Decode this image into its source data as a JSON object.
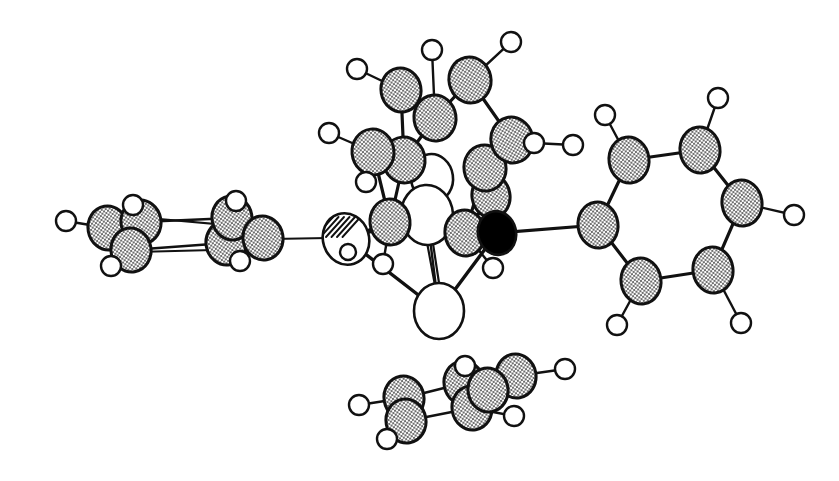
{
  "figure": {
    "subtitle": "ORTEP-style ball-and-stick crystallographic structure drawing",
    "type": "chemical-structure-diagram",
    "background_color": "#ffffff",
    "outline_color": "#111111",
    "canvas": {
      "width": 839,
      "height": 481
    },
    "caption": ""
  },
  "legend": {
    "styles": [
      {
        "key": "carbon",
        "label": "carbon",
        "fill": "#8f8f8f",
        "pattern": "checkerboard-hatch",
        "note": "medium shaded sphere"
      },
      {
        "key": "hydrogen",
        "label": "hydrogen",
        "fill": "#ffffff",
        "pattern": "open",
        "note": "small open circle"
      },
      {
        "key": "metal_open",
        "label": "metal (open)",
        "fill": "#ffffff",
        "pattern": "open",
        "note": "large open sphere"
      },
      {
        "key": "metal_hatched",
        "label": "metal (line-hatched)",
        "fill": "#ffffff",
        "pattern": "diagonal-lines",
        "note": "large sphere with diagonal hatch lines"
      },
      {
        "key": "heteroatom_black",
        "label": "heteroatom (solid)",
        "fill": "#000000",
        "pattern": "solid",
        "note": "solid black sphere"
      }
    ]
  },
  "chart_data": {
    "type": "scatter",
    "xlabel": "",
    "ylabel": "",
    "grid": false,
    "legend_position": "none",
    "xlim": [
      0,
      839
    ],
    "ylim": [
      0,
      481
    ],
    "counts": {
      "carbon_spheres": 28,
      "hydrogen_circles": 26,
      "open_metal_spheres": 3,
      "hatched_metal_spheres": 1,
      "solid_black_spheres": 1,
      "bonds": 63
    },
    "atoms": [
      {
        "id": "M1",
        "style": "metal_hatched",
        "x": 346,
        "y": 239,
        "rx": 23,
        "ry": 26,
        "rot": -18,
        "z": 20
      },
      {
        "id": "M2",
        "style": "metal_open",
        "x": 432,
        "y": 178,
        "rx": 21,
        "ry": 24,
        "rot": -8,
        "z": 14
      },
      {
        "id": "M3",
        "style": "metal_open",
        "x": 427,
        "y": 215,
        "rx": 26,
        "ry": 30,
        "rot": -4,
        "z": 16
      },
      {
        "id": "M4",
        "style": "metal_open",
        "x": 439,
        "y": 311,
        "rx": 25,
        "ry": 28,
        "rot": 0,
        "z": 14
      },
      {
        "id": "X1",
        "style": "heteroatom_black",
        "x": 497,
        "y": 233,
        "rx": 19,
        "ry": 22,
        "rot": -14,
        "z": 40
      },
      {
        "id": "C1",
        "style": "carbon",
        "x": 401,
        "y": 90,
        "rx": 20,
        "ry": 22,
        "rot": -10,
        "z": 26
      },
      {
        "id": "C2",
        "style": "carbon",
        "x": 470,
        "y": 80,
        "rx": 21,
        "ry": 23,
        "rot": -12,
        "z": 26
      },
      {
        "id": "C3",
        "style": "carbon",
        "x": 435,
        "y": 118,
        "rx": 21,
        "ry": 23,
        "rot": -8,
        "z": 25
      },
      {
        "id": "C4",
        "style": "carbon",
        "x": 512,
        "y": 140,
        "rx": 21,
        "ry": 23,
        "rot": -14,
        "z": 25
      },
      {
        "id": "C5",
        "style": "carbon",
        "x": 373,
        "y": 152,
        "rx": 21,
        "ry": 23,
        "rot": -6,
        "z": 24
      },
      {
        "id": "C6",
        "style": "carbon",
        "x": 404,
        "y": 160,
        "rx": 21,
        "ry": 23,
        "rot": -6,
        "z": 23
      },
      {
        "id": "C7",
        "style": "carbon",
        "x": 485,
        "y": 168,
        "rx": 21,
        "ry": 23,
        "rot": -10,
        "z": 24
      },
      {
        "id": "C8",
        "style": "carbon",
        "x": 491,
        "y": 196,
        "rx": 19,
        "ry": 22,
        "rot": -10,
        "z": 22
      },
      {
        "id": "C9",
        "style": "carbon",
        "x": 390,
        "y": 222,
        "rx": 20,
        "ry": 23,
        "rot": -6,
        "z": 21
      },
      {
        "id": "C10",
        "style": "carbon",
        "x": 465,
        "y": 233,
        "rx": 20,
        "ry": 23,
        "rot": -8,
        "z": 21
      },
      {
        "id": "C11",
        "style": "carbon",
        "x": 598,
        "y": 225,
        "rx": 20,
        "ry": 23,
        "rot": -8,
        "z": 18
      },
      {
        "id": "C12",
        "style": "carbon",
        "x": 629,
        "y": 160,
        "rx": 20,
        "ry": 23,
        "rot": -8,
        "z": 18
      },
      {
        "id": "C13",
        "style": "carbon",
        "x": 700,
        "y": 150,
        "rx": 20,
        "ry": 23,
        "rot": -8,
        "z": 18
      },
      {
        "id": "C14",
        "style": "carbon",
        "x": 742,
        "y": 203,
        "rx": 20,
        "ry": 23,
        "rot": -8,
        "z": 18
      },
      {
        "id": "C15",
        "style": "carbon",
        "x": 713,
        "y": 270,
        "rx": 20,
        "ry": 23,
        "rot": -8,
        "z": 18
      },
      {
        "id": "C16",
        "style": "carbon",
        "x": 641,
        "y": 281,
        "rx": 20,
        "ry": 23,
        "rot": -8,
        "z": 18
      },
      {
        "id": "C21",
        "style": "carbon",
        "x": 108,
        "y": 228,
        "rx": 20,
        "ry": 22,
        "rot": -10,
        "z": 12
      },
      {
        "id": "C22",
        "style": "carbon",
        "x": 141,
        "y": 222,
        "rx": 20,
        "ry": 22,
        "rot": -10,
        "z": 12
      },
      {
        "id": "C23",
        "style": "carbon",
        "x": 131,
        "y": 250,
        "rx": 20,
        "ry": 22,
        "rot": -10,
        "z": 12
      },
      {
        "id": "C24",
        "style": "carbon",
        "x": 226,
        "y": 243,
        "rx": 20,
        "ry": 22,
        "rot": -10,
        "z": 12
      },
      {
        "id": "C25",
        "style": "carbon",
        "x": 232,
        "y": 218,
        "rx": 20,
        "ry": 22,
        "rot": -10,
        "z": 12
      },
      {
        "id": "C26",
        "style": "carbon",
        "x": 263,
        "y": 238,
        "rx": 20,
        "ry": 22,
        "rot": -10,
        "z": 12
      },
      {
        "id": "C31",
        "style": "carbon",
        "x": 404,
        "y": 398,
        "rx": 20,
        "ry": 22,
        "rot": -10,
        "z": 10
      },
      {
        "id": "C32",
        "style": "carbon",
        "x": 406,
        "y": 421,
        "rx": 20,
        "ry": 22,
        "rot": -10,
        "z": 10
      },
      {
        "id": "C33",
        "style": "carbon",
        "x": 464,
        "y": 383,
        "rx": 20,
        "ry": 22,
        "rot": -10,
        "z": 10
      },
      {
        "id": "C34",
        "style": "carbon",
        "x": 472,
        "y": 408,
        "rx": 20,
        "ry": 22,
        "rot": -10,
        "z": 10
      },
      {
        "id": "C35",
        "style": "carbon",
        "x": 516,
        "y": 376,
        "rx": 20,
        "ry": 22,
        "rot": -10,
        "z": 10
      },
      {
        "id": "C36",
        "style": "carbon",
        "x": 488,
        "y": 390,
        "rx": 20,
        "ry": 22,
        "rot": -10,
        "z": 10
      },
      {
        "id": "H1",
        "style": "hydrogen",
        "x": 357,
        "y": 69,
        "r": 10,
        "z": 30
      },
      {
        "id": "H2",
        "style": "hydrogen",
        "x": 432,
        "y": 50,
        "r": 10,
        "z": 30
      },
      {
        "id": "H3",
        "style": "hydrogen",
        "x": 511,
        "y": 42,
        "r": 10,
        "z": 30
      },
      {
        "id": "H4",
        "style": "hydrogen",
        "x": 329,
        "y": 133,
        "r": 10,
        "z": 30
      },
      {
        "id": "H5",
        "style": "hydrogen",
        "x": 366,
        "y": 182,
        "r": 10,
        "z": 30
      },
      {
        "id": "H6",
        "style": "hydrogen",
        "x": 534,
        "y": 143,
        "r": 10,
        "z": 30
      },
      {
        "id": "H7",
        "style": "hydrogen",
        "x": 573,
        "y": 145,
        "r": 10,
        "z": 30
      },
      {
        "id": "H8",
        "style": "hydrogen",
        "x": 383,
        "y": 264,
        "r": 10,
        "z": 45
      },
      {
        "id": "H9",
        "style": "hydrogen",
        "x": 493,
        "y": 268,
        "r": 10,
        "z": 45
      },
      {
        "id": "H11",
        "style": "hydrogen",
        "x": 605,
        "y": 115,
        "r": 10,
        "z": 22
      },
      {
        "id": "H12",
        "style": "hydrogen",
        "x": 718,
        "y": 98,
        "r": 10,
        "z": 22
      },
      {
        "id": "H13",
        "style": "hydrogen",
        "x": 794,
        "y": 215,
        "r": 10,
        "z": 22
      },
      {
        "id": "H14",
        "style": "hydrogen",
        "x": 741,
        "y": 323,
        "r": 10,
        "z": 22
      },
      {
        "id": "H15",
        "style": "hydrogen",
        "x": 617,
        "y": 325,
        "r": 10,
        "z": 22
      },
      {
        "id": "H21",
        "style": "hydrogen",
        "x": 66,
        "y": 221,
        "r": 10,
        "z": 14
      },
      {
        "id": "H22",
        "style": "hydrogen",
        "x": 133,
        "y": 205,
        "r": 10,
        "z": 18
      },
      {
        "id": "H23",
        "style": "hydrogen",
        "x": 111,
        "y": 266,
        "r": 10,
        "z": 18
      },
      {
        "id": "H24",
        "style": "hydrogen",
        "x": 240,
        "y": 261,
        "r": 10,
        "z": 18
      },
      {
        "id": "H25",
        "style": "hydrogen",
        "x": 236,
        "y": 201,
        "r": 10,
        "z": 18
      },
      {
        "id": "H31",
        "style": "hydrogen",
        "x": 359,
        "y": 405,
        "r": 10,
        "z": 12
      },
      {
        "id": "H32",
        "style": "hydrogen",
        "x": 387,
        "y": 439,
        "r": 10,
        "z": 12
      },
      {
        "id": "H33",
        "style": "hydrogen",
        "x": 465,
        "y": 366,
        "r": 10,
        "z": 12
      },
      {
        "id": "H34",
        "style": "hydrogen",
        "x": 514,
        "y": 416,
        "r": 10,
        "z": 12
      },
      {
        "id": "H35",
        "style": "hydrogen",
        "x": 565,
        "y": 369,
        "r": 10,
        "z": 12
      }
    ],
    "bonds": [
      {
        "a": "C1",
        "b": "H1",
        "w": 2.4
      },
      {
        "a": "C3",
        "b": "H2",
        "w": 2.4
      },
      {
        "a": "C2",
        "b": "H3",
        "w": 2.4
      },
      {
        "a": "C5",
        "b": "H4",
        "w": 2.4
      },
      {
        "a": "C5",
        "b": "H5",
        "w": 2.4
      },
      {
        "a": "C4",
        "b": "H6",
        "w": 2.4
      },
      {
        "a": "H6",
        "b": "H7",
        "w": 2.4
      },
      {
        "a": "C9",
        "b": "H8",
        "w": 2.4
      },
      {
        "a": "C10",
        "b": "H9",
        "w": 2.4
      },
      {
        "a": "C1",
        "b": "C3",
        "w": 3.2
      },
      {
        "a": "C3",
        "b": "C2",
        "w": 3.2
      },
      {
        "a": "C2",
        "b": "C4",
        "w": 3.2
      },
      {
        "a": "C1",
        "b": "C6",
        "w": 3.2
      },
      {
        "a": "C3",
        "b": "C6",
        "w": 3.2
      },
      {
        "a": "C4",
        "b": "C7",
        "w": 3.2
      },
      {
        "a": "C5",
        "b": "C6",
        "w": 3.2
      },
      {
        "a": "C5",
        "b": "C9",
        "w": 3.2
      },
      {
        "a": "C6",
        "b": "C9",
        "w": 3.2
      },
      {
        "a": "C7",
        "b": "C8",
        "w": 3.2
      },
      {
        "a": "C8",
        "b": "C10",
        "w": 3.2
      },
      {
        "a": "C7",
        "b": "C10",
        "w": 3.2
      },
      {
        "a": "M1",
        "b": "C9",
        "w": 3.0
      },
      {
        "a": "M1",
        "b": "M3",
        "w": 3.0
      },
      {
        "a": "M1",
        "b": "M4",
        "w": 3.4
      },
      {
        "a": "M3",
        "b": "C10",
        "w": 3.0
      },
      {
        "a": "M3",
        "b": "M4",
        "w": 2.4
      },
      {
        "a": "M2",
        "b": "M3",
        "w": 2.4
      },
      {
        "a": "M4",
        "b": "X1",
        "w": 3.4
      },
      {
        "a": "C10",
        "b": "X1",
        "w": 3.0
      },
      {
        "a": "C8",
        "b": "X1",
        "w": 3.0
      },
      {
        "a": "M1",
        "b": "C21ringlink",
        "w": 2.4
      },
      {
        "a": "X1",
        "b": "C11",
        "w": 3.0
      },
      {
        "a": "C11",
        "b": "C12",
        "w": 3.2
      },
      {
        "a": "C12",
        "b": "C13",
        "w": 3.2
      },
      {
        "a": "C13",
        "b": "C14",
        "w": 3.2
      },
      {
        "a": "C14",
        "b": "C15",
        "w": 3.2
      },
      {
        "a": "C15",
        "b": "C16",
        "w": 3.2
      },
      {
        "a": "C16",
        "b": "C11",
        "w": 3.2
      },
      {
        "a": "C12",
        "b": "H11",
        "w": 2.4
      },
      {
        "a": "C13",
        "b": "H12",
        "w": 2.4
      },
      {
        "a": "C14",
        "b": "H13",
        "w": 2.4
      },
      {
        "a": "C15",
        "b": "H14",
        "w": 2.4
      },
      {
        "a": "C16",
        "b": "H15",
        "w": 2.4
      },
      {
        "a": "C21",
        "b": "H21",
        "w": 2.4
      },
      {
        "a": "C22",
        "b": "H22",
        "w": 2.4
      },
      {
        "a": "C23",
        "b": "H23",
        "w": 2.4
      },
      {
        "a": "C26",
        "b": "H24",
        "w": 2.4
      },
      {
        "a": "C25",
        "b": "H25",
        "w": 2.4
      },
      {
        "a": "C21",
        "b": "C22",
        "w": 2.4
      },
      {
        "a": "C21",
        "b": "C23",
        "w": 2.4
      },
      {
        "a": "C22",
        "b": "C25",
        "w": 2.4
      },
      {
        "a": "C23",
        "b": "C24",
        "w": 2.4
      },
      {
        "a": "C24",
        "b": "C26",
        "w": 2.4
      },
      {
        "a": "C25",
        "b": "C26",
        "w": 2.4
      },
      {
        "a": "C31",
        "b": "H31",
        "w": 2.4
      },
      {
        "a": "C32",
        "b": "H32",
        "w": 2.4
      },
      {
        "a": "C33",
        "b": "H33",
        "w": 2.4
      },
      {
        "a": "C34",
        "b": "H34",
        "w": 2.4
      },
      {
        "a": "C35",
        "b": "H35",
        "w": 2.4
      },
      {
        "a": "C31",
        "b": "C33",
        "w": 2.4
      },
      {
        "a": "C31",
        "b": "C32",
        "w": 2.4
      },
      {
        "a": "C32",
        "b": "C34",
        "w": 2.4
      },
      {
        "a": "C33",
        "b": "C36",
        "w": 2.4
      },
      {
        "a": "C34",
        "b": "C36",
        "w": 2.4
      },
      {
        "a": "C35",
        "b": "C36",
        "w": 2.4
      },
      {
        "a": "C33",
        "b": "C35",
        "w": 2.4
      }
    ],
    "extra_bonds": [
      {
        "name": "metal-to-left-phenyl",
        "x1": 328,
        "y1": 238,
        "x2": 272,
        "y2": 239,
        "w": 2.2
      },
      {
        "name": "left-phenyl-upper-strut",
        "x1": 260,
        "y1": 228,
        "x2": 148,
        "y2": 218,
        "w": 2.2
      },
      {
        "name": "left-phenyl-lower-strut",
        "x1": 252,
        "y1": 249,
        "x2": 136,
        "y2": 252,
        "w": 2.2
      },
      {
        "name": "metal-double-bond-a",
        "x1": 426,
        "y1": 237,
        "x2": 437,
        "y2": 296,
        "w": 2.2
      },
      {
        "name": "metal-double-bond-b",
        "x1": 432,
        "y1": 237,
        "x2": 441,
        "y2": 296,
        "w": 2.2
      },
      {
        "name": "metal-carbonyl-strut",
        "x1": 358,
        "y1": 232,
        "x2": 472,
        "y2": 231,
        "w": 2.2
      }
    ]
  }
}
